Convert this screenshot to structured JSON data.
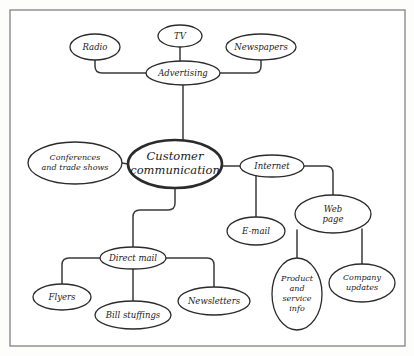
{
  "diagram": {
    "frame": {
      "x": 10,
      "y": 10,
      "width": 395,
      "height": 336
    },
    "style": {
      "background_color": "#ffffff",
      "node_fill": "#ffffff",
      "node_stroke": "#2b2b2b",
      "edge_stroke": "#3a3a3a",
      "frame_stroke": "#8a8a8a",
      "text_color": "#1a1a1a"
    },
    "nodes": [
      {
        "id": "radio",
        "label": "Radio",
        "cx": 95,
        "cy": 47,
        "rx": 25,
        "ry": 13,
        "font_size": 8.5,
        "central": false,
        "lines": [
          "Radio"
        ]
      },
      {
        "id": "tv",
        "label": "TV",
        "cx": 180,
        "cy": 36,
        "rx": 22,
        "ry": 11,
        "font_size": 8.5,
        "central": false,
        "lines": [
          "TV"
        ]
      },
      {
        "id": "newspapers",
        "label": "Newspapers",
        "cx": 261,
        "cy": 47,
        "rx": 35,
        "ry": 13,
        "font_size": 8.5,
        "central": false,
        "lines": [
          "Newspapers"
        ]
      },
      {
        "id": "advertising",
        "label": "Advertising",
        "cx": 183,
        "cy": 73,
        "rx": 37,
        "ry": 12,
        "font_size": 8.5,
        "central": false,
        "lines": [
          "Advertising"
        ]
      },
      {
        "id": "conferences",
        "label": "Conferences and trade shows",
        "cx": 75,
        "cy": 163,
        "rx": 47,
        "ry": 21,
        "font_size": 8,
        "central": false,
        "lines": [
          "Conferences",
          "and trade shows"
        ]
      },
      {
        "id": "customer_communication",
        "label": "Customer communication",
        "cx": 175,
        "cy": 164,
        "rx": 47,
        "ry": 24,
        "font_size": 11.5,
        "central": true,
        "lines": [
          "Customer",
          "communication"
        ]
      },
      {
        "id": "internet",
        "label": "Internet",
        "cx": 272,
        "cy": 166,
        "rx": 32,
        "ry": 11,
        "font_size": 8.5,
        "central": false,
        "lines": [
          "Internet"
        ]
      },
      {
        "id": "email",
        "label": "E-mail",
        "cx": 256,
        "cy": 231,
        "rx": 29,
        "ry": 14,
        "font_size": 8.5,
        "central": false,
        "lines": [
          "E-mail"
        ]
      },
      {
        "id": "web_page",
        "label": "Web page",
        "cx": 333,
        "cy": 214,
        "rx": 38,
        "ry": 19,
        "font_size": 8.5,
        "central": false,
        "lines": [
          "Web",
          "page"
        ]
      },
      {
        "id": "product_service_info",
        "label": "Product and service info",
        "cx": 297,
        "cy": 294,
        "rx": 25,
        "ry": 36,
        "font_size": 8,
        "central": false,
        "lines": [
          "Product",
          "and",
          "service",
          "info"
        ]
      },
      {
        "id": "company_updates",
        "label": "Company updates",
        "cx": 362,
        "cy": 283,
        "rx": 33,
        "ry": 19,
        "font_size": 8,
        "central": false,
        "lines": [
          "Company",
          "updates"
        ]
      },
      {
        "id": "direct_mail",
        "label": "Direct mail",
        "cx": 133,
        "cy": 258,
        "rx": 33,
        "ry": 11,
        "font_size": 8.5,
        "central": false,
        "lines": [
          "Direct mail"
        ]
      },
      {
        "id": "flyers",
        "label": "Flyers",
        "cx": 62,
        "cy": 297,
        "rx": 29,
        "ry": 13,
        "font_size": 8.5,
        "central": false,
        "lines": [
          "Flyers"
        ]
      },
      {
        "id": "bill_stuffings",
        "label": "Bill stuffings",
        "cx": 133,
        "cy": 315,
        "rx": 38,
        "ry": 14,
        "font_size": 8.5,
        "central": false,
        "lines": [
          "Bill stuffings"
        ]
      },
      {
        "id": "newsletters",
        "label": "Newsletters",
        "cx": 214,
        "cy": 301,
        "rx": 36,
        "ry": 14,
        "font_size": 8.5,
        "central": false,
        "lines": [
          "Newsletters"
        ]
      }
    ],
    "edges": [
      {
        "id": "edge-radio-advertising",
        "from": "radio",
        "to": "advertising",
        "path": "M 95 60 L 95 66 Q 95 73 102 73 L 146 73"
      },
      {
        "id": "edge-tv-advertising",
        "from": "tv",
        "to": "advertising",
        "path": "M 180 47 L 180 61"
      },
      {
        "id": "edge-newspapers-advertising",
        "from": "newspapers",
        "to": "advertising",
        "path": "M 261 60 L 261 66 Q 261 73 254 73 L 220 73"
      },
      {
        "id": "edge-advertising-customer",
        "from": "advertising",
        "to": "customer_communication",
        "path": "M 183 85 L 183 140"
      },
      {
        "id": "edge-conferences-customer",
        "from": "conferences",
        "to": "customer_communication",
        "path": "M 122 163 L 128 164"
      },
      {
        "id": "edge-customer-internet",
        "from": "customer_communication",
        "to": "internet",
        "path": "M 222 166 L 240 166"
      },
      {
        "id": "edge-internet-email",
        "from": "internet",
        "to": "email",
        "path": "M 256 174 L 256 217"
      },
      {
        "id": "edge-internet-webpage",
        "from": "internet",
        "to": "web_page",
        "path": "M 304 166 L 326 166 Q 333 166 333 173 L 333 195"
      },
      {
        "id": "edge-webpage-product",
        "from": "web_page",
        "to": "product_service_info",
        "path": "M 297 230 L 297 258"
      },
      {
        "id": "edge-webpage-company",
        "from": "web_page",
        "to": "company_updates",
        "path": "M 362 229 L 362 264"
      },
      {
        "id": "edge-customer-directmail",
        "from": "customer_communication",
        "to": "direct_mail",
        "path": "M 175 188 L 175 203 Q 175 210 168 210 L 140 210 Q 133 210 133 217 L 133 247"
      },
      {
        "id": "edge-directmail-flyers",
        "from": "direct_mail",
        "to": "flyers",
        "path": "M 100 258 L 69 258 Q 62 258 62 265 L 62 284"
      },
      {
        "id": "edge-directmail-bill",
        "from": "direct_mail",
        "to": "bill_stuffings",
        "path": "M 133 269 L 133 301"
      },
      {
        "id": "edge-directmail-newsletters",
        "from": "direct_mail",
        "to": "newsletters",
        "path": "M 166 258 L 207 258 Q 214 258 214 265 L 214 287"
      }
    ]
  }
}
